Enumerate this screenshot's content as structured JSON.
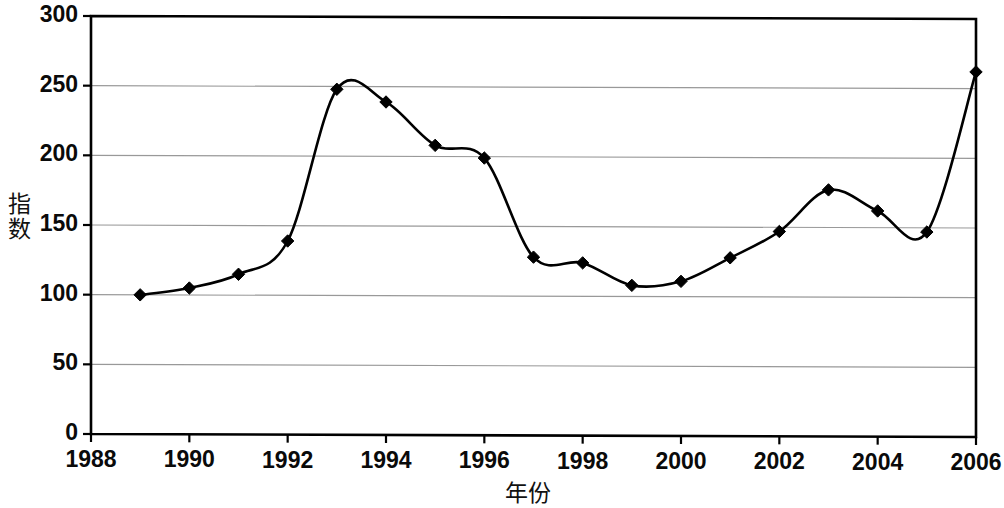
{
  "chart_data": {
    "type": "line",
    "title": "",
    "subtitle": "",
    "xlabel": "年份",
    "ylabel": "指数",
    "xlim": [
      1988,
      2006
    ],
    "ylim": [
      0,
      300
    ],
    "grid": true,
    "grid_axis": "y",
    "legend": "none",
    "marker": "diamond",
    "marker_color": "#000000",
    "line_color": "#000000",
    "grid_color": "#999999",
    "axis_color": "#000000",
    "background_color": "#ffffff",
    "x": [
      1989,
      1990,
      1991,
      1992,
      1993,
      1994,
      1995,
      1996,
      1997,
      1998,
      1999,
      2000,
      2001,
      2002,
      2003,
      2004,
      2005,
      2006
    ],
    "values": [
      100,
      105,
      115,
      139,
      248,
      239,
      208,
      199,
      128,
      124,
      108,
      111,
      128,
      147,
      177,
      162,
      147,
      262
    ],
    "series": [
      {
        "name": "指数",
        "values": [
          100,
          105,
          115,
          139,
          248,
          239,
          208,
          199,
          128,
          124,
          108,
          111,
          128,
          147,
          177,
          162,
          147,
          262
        ]
      }
    ],
    "xticks": [
      1988,
      1990,
      1992,
      1994,
      1996,
      1998,
      2000,
      2002,
      2004,
      2006
    ],
    "xtick_labels": [
      "1988",
      "1990",
      "1992",
      "1994",
      "1996",
      "1998",
      "2000",
      "2002",
      "2004",
      "2006"
    ],
    "yticks": [
      0,
      50,
      100,
      150,
      200,
      250,
      300
    ],
    "ytick_labels": [
      "0",
      "50",
      "100",
      "150",
      "200",
      "250",
      "300"
    ]
  }
}
